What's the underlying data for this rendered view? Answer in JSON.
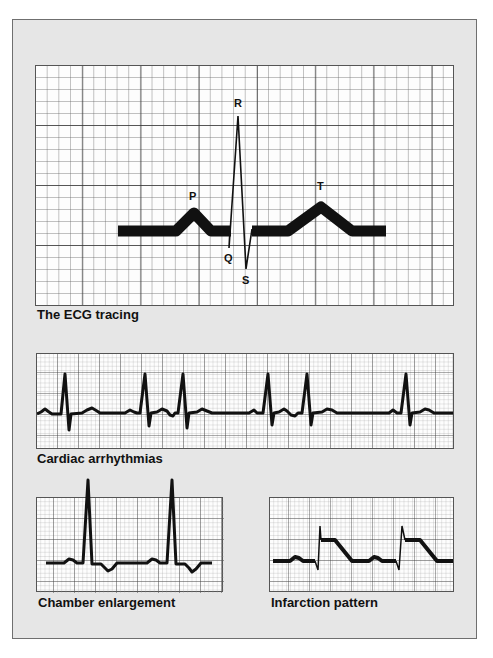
{
  "figure": {
    "panels": [
      {
        "id": "ecg-tracing",
        "caption": "The ECG tracing",
        "wave_labels": {
          "P": "P",
          "Q": "Q",
          "R": "R",
          "S": "S",
          "T": "T"
        }
      },
      {
        "id": "cardiac-arrhythmias",
        "caption": "Cardiac arrhythmias"
      },
      {
        "id": "chamber-enlargement",
        "caption": "Chamber enlargement"
      },
      {
        "id": "infarction-pattern",
        "caption": "Infarction pattern"
      }
    ]
  },
  "colors": {
    "background": "#e6e6e6",
    "grid_paper": "#fdfdfd",
    "grid_line": "#555555",
    "trace": "#111111"
  }
}
